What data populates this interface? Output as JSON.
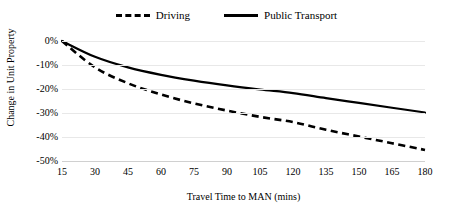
{
  "chart_data": {
    "type": "line",
    "title": "",
    "xlabel": "Travel Time to MAN (mins)",
    "ylabel": "Change in Unit Property",
    "xlim": [
      15,
      180
    ],
    "ylim": [
      -50,
      0
    ],
    "grid": true,
    "legend_position": "top-center",
    "x_tick_labels": [
      "15",
      "30",
      "45",
      "60",
      "75",
      "90",
      "105",
      "120",
      "135",
      "150",
      "165",
      "180"
    ],
    "x": [
      15,
      30,
      45,
      60,
      75,
      90,
      105,
      120,
      135,
      150,
      165,
      180
    ],
    "y_tick_labels": [
      "0%",
      "-10%",
      "-20%",
      "-30%",
      "-40%",
      "-50%"
    ],
    "y_ticks": [
      0,
      -10,
      -20,
      -30,
      -40,
      -50
    ],
    "series": [
      {
        "name": "Driving",
        "style": "dashed",
        "color": "#000000",
        "values": [
          0,
          -11.0,
          -17.6,
          -22.3,
          -26.0,
          -29.0,
          -31.6,
          -33.8,
          -37.0,
          -39.8,
          -42.6,
          -45.4
        ]
      },
      {
        "name": "Public Transport",
        "style": "solid",
        "color": "#000000",
        "values": [
          0,
          -6.6,
          -11.0,
          -14.1,
          -16.5,
          -18.5,
          -20.2,
          -21.7,
          -23.8,
          -25.8,
          -27.8,
          -29.8
        ]
      }
    ]
  },
  "legend": {
    "entries": [
      {
        "label": "Driving",
        "swatch": "dashed-line-swatch"
      },
      {
        "label": "Public Transport",
        "swatch": "solid-line-swatch"
      }
    ]
  },
  "axes": {
    "x_title": "Travel Time to MAN (mins)",
    "y_title": "Change in Unit Property"
  }
}
